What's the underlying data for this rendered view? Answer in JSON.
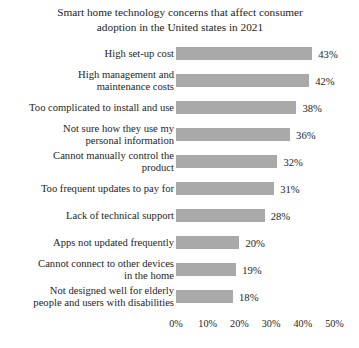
{
  "chart_data": {
    "type": "bar",
    "orientation": "horizontal",
    "title": "Smart home technology concerns that affect consumer adoption in the United states in 2021",
    "title_line1": "Smart home technology concerns that affect consumer",
    "title_line2": "adoption in the United states in 2021",
    "xlabel": "",
    "ylabel": "",
    "xlim": [
      0,
      50
    ],
    "grid": false,
    "legend": false,
    "bar_color": "#a9a9a9",
    "categories": [
      "High set-up cost",
      "High management and maintenance costs",
      "Too complicated to install and use",
      "Not sure how they use my personal information",
      "Cannot manually control the product",
      "Too frequent updates to pay for",
      "Lack of technical support",
      "Apps not updated frequently",
      "Cannot connect to other devices in the home",
      "Not designed well for elderly people and users with disabilities"
    ],
    "category_lines": [
      [
        "High set-up cost"
      ],
      [
        "High management and",
        "maintenance costs"
      ],
      [
        "Too complicated to install and use"
      ],
      [
        "Not sure how they use my",
        "personal information"
      ],
      [
        "Cannot manually control the",
        "product"
      ],
      [
        "Too frequent updates to pay for"
      ],
      [
        "Lack of technical support"
      ],
      [
        "Apps not updated frequently"
      ],
      [
        "Cannot connect to other devices",
        "in the home"
      ],
      [
        "Not designed well for elderly",
        "people and users with disabilities"
      ]
    ],
    "values": [
      43,
      42,
      38,
      36,
      32,
      31,
      28,
      20,
      19,
      18
    ],
    "value_labels": [
      "43%",
      "42%",
      "38%",
      "36%",
      "32%",
      "31%",
      "28%",
      "20%",
      "19%",
      "18%"
    ],
    "xticks": [
      0,
      10,
      20,
      30,
      40,
      50
    ],
    "xtick_labels": [
      "0%",
      "10%",
      "20%",
      "30%",
      "40%",
      "50%"
    ]
  }
}
